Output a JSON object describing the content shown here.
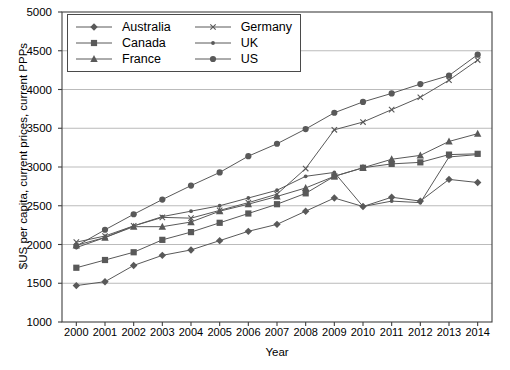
{
  "chart_data": {
    "type": "line",
    "title": "",
    "xlabel": "Year",
    "ylabel": "$US per capita, current prices, current PPPs",
    "grid": true,
    "legend_position": "top-left",
    "xlim": [
      2000,
      2014
    ],
    "ylim": [
      1000,
      5000
    ],
    "ytick_step": 500,
    "categories": [
      2000,
      2001,
      2002,
      2003,
      2004,
      2005,
      2006,
      2007,
      2008,
      2009,
      2010,
      2011,
      2012,
      2013,
      2014
    ],
    "xtick_labels": [
      "2000",
      "2001",
      "2002",
      "2003",
      "2004",
      "2005",
      "2006",
      "2007",
      "2008",
      "2009",
      "2010",
      "2011",
      "2012",
      "2013",
      "2014"
    ],
    "ytick_labels": [
      "1000",
      "1500",
      "2000",
      "2500",
      "3000",
      "3500",
      "4000",
      "4500",
      "5000"
    ],
    "series": [
      {
        "name": "Australia",
        "marker": "diamond",
        "values": [
          1470,
          1520,
          1730,
          1860,
          1930,
          2050,
          2170,
          2260,
          2430,
          2600,
          2490,
          2610,
          2560,
          2840,
          2800
        ]
      },
      {
        "name": "Canada",
        "marker": "square",
        "values": [
          1700,
          1800,
          1900,
          2060,
          2160,
          2280,
          2400,
          2520,
          2660,
          2880,
          2990,
          3040,
          3060,
          3160,
          3170
        ]
      },
      {
        "name": "France",
        "marker": "triangle",
        "values": [
          1990,
          2090,
          2230,
          2230,
          2290,
          2430,
          2520,
          2620,
          2730,
          2880,
          2990,
          3100,
          3150,
          3330,
          3430
        ]
      },
      {
        "name": "Germany",
        "marker": "x",
        "values": [
          2030,
          2110,
          2240,
          2350,
          2340,
          2440,
          2540,
          2650,
          2980,
          3480,
          3580,
          3740,
          3900,
          4120,
          4380
        ]
      },
      {
        "name": "UK",
        "marker": "dot",
        "values": [
          1960,
          2090,
          2240,
          2360,
          2430,
          2500,
          2600,
          2700,
          2880,
          2930,
          2490,
          2560,
          2540,
          3130,
          3160
        ]
      },
      {
        "name": "US",
        "marker": "circle",
        "values": [
          1380,
          1520,
          1690,
          1800,
          1930,
          2040,
          2170,
          2280,
          2390,
          2500,
          2600,
          2700,
          2800,
          2900,
          3000
        ]
      }
    ],
    "legend_entries": [
      "Australia",
      "Canada",
      "France",
      "Germany",
      "UK",
      "US"
    ],
    "series_us_actual": [
      1980,
      2190,
      2390,
      2580,
      2760,
      2930,
      3140,
      3300,
      3490,
      3700,
      3840,
      3950,
      4070,
      4180,
      4450
    ],
    "line_color": "#595959",
    "grid_color": "#aaaaaa",
    "frame_color": "#404040"
  }
}
